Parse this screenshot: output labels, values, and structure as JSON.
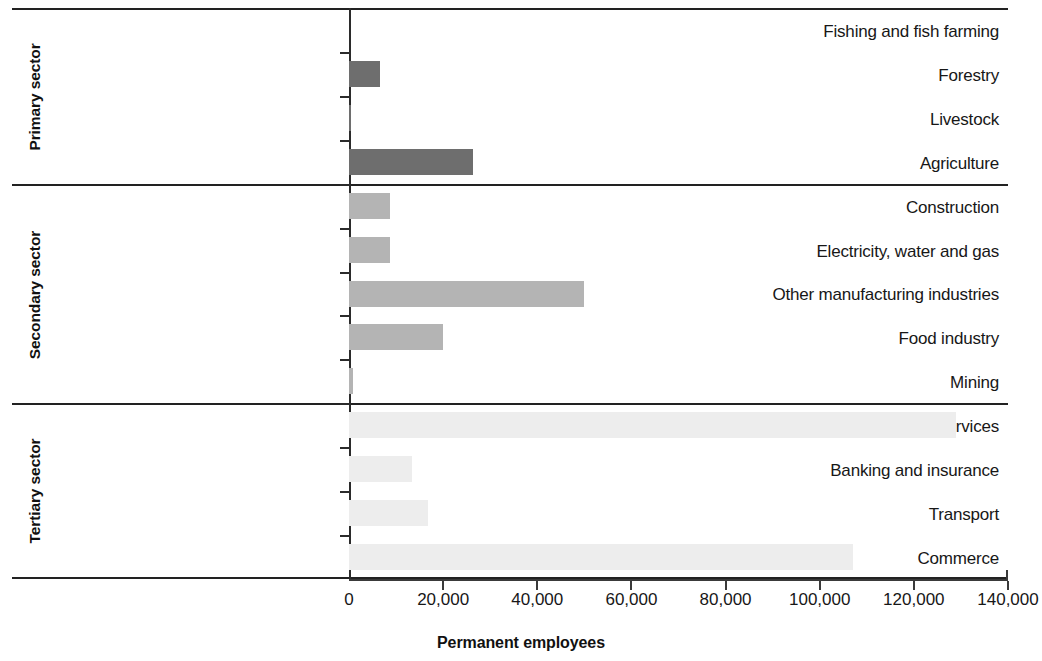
{
  "chart_data": {
    "type": "bar",
    "orientation": "horizontal",
    "title": "",
    "xlabel": "Permanent employees",
    "ylabel": "",
    "xlim": [
      0,
      140000
    ],
    "xticks": [
      0,
      20000,
      40000,
      60000,
      80000,
      100000,
      120000,
      140000
    ],
    "xtick_labels": [
      "0",
      "20,000",
      "40,000",
      "60,000",
      "80,000",
      "100,000",
      "120,000",
      "140,000"
    ],
    "grid": false,
    "legend": null,
    "categories": [
      "Fishing and fish farming",
      "Forestry",
      "Livestock",
      "Agriculture",
      "Construction",
      "Electricity, water and gas",
      "Other manufacturing industries",
      "Food industry",
      "Mining",
      "Other services",
      "Banking and insurance",
      "Transport",
      "Commerce"
    ],
    "values": [
      0,
      6500,
      500,
      26300,
      8700,
      8700,
      49900,
      19900,
      800,
      129000,
      13400,
      16800,
      107000
    ],
    "groups": [
      {
        "name": "Primary sector",
        "color": "#6e6e6e",
        "items": [
          {
            "label": "Fishing and fish farming",
            "value": 0
          },
          {
            "label": "Forestry",
            "value": 6500
          },
          {
            "label": "Livestock",
            "value": 500
          },
          {
            "label": "Agriculture",
            "value": 26300
          }
        ]
      },
      {
        "name": "Secondary sector",
        "color": "#b4b4b4",
        "items": [
          {
            "label": "Construction",
            "value": 8700
          },
          {
            "label": "Electricity, water and gas",
            "value": 8700
          },
          {
            "label": "Other manufacturing industries",
            "value": 49900
          },
          {
            "label": "Food industry",
            "value": 19900
          },
          {
            "label": "Mining",
            "value": 800
          }
        ]
      },
      {
        "name": "Tertiary sector",
        "color": "#ededed",
        "items": [
          {
            "label": "Other services",
            "value": 129000
          },
          {
            "label": "Banking and insurance",
            "value": 13400
          },
          {
            "label": "Transport",
            "value": 16800
          },
          {
            "label": "Commerce",
            "value": 107000
          }
        ]
      }
    ]
  },
  "geometry": {
    "x0": 349,
    "x_max_px": 1008,
    "group_bounds": [
      {
        "top": 8,
        "bottom": 184
      },
      {
        "top": 184,
        "bottom": 403
      },
      {
        "top": 403,
        "bottom": 579
      }
    ],
    "axis_y": 579,
    "tick_label_y": 590,
    "xaxis_title_y": 634,
    "bar_height": 26
  }
}
